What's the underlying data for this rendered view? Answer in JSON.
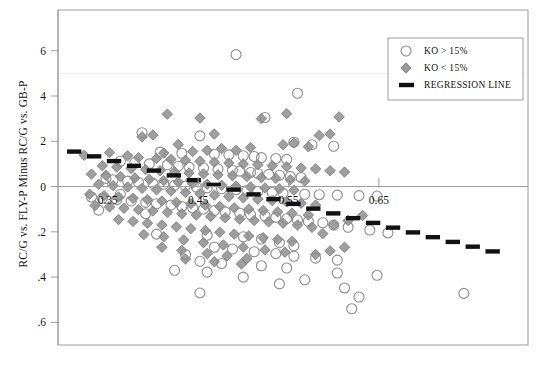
{
  "chart_data": {
    "type": "scatter",
    "title": "",
    "xlabel": "",
    "ylabel": "RC/G vs. FLY-P Minus RC/G vs. GB-P",
    "xlim": [
      0.295,
      0.815
    ],
    "ylim": [
      -0.7,
      0.78
    ],
    "grid": false,
    "x_ticks": [
      0.35,
      0.45,
      0.55,
      0.65
    ],
    "x_tick_labels": [
      "0.35",
      "0.45",
      "0.55",
      "0.65"
    ],
    "y_ticks": [
      0.6,
      0.4,
      0.2,
      0.0,
      -0.2,
      -0.4,
      -0.6
    ],
    "y_tick_labels": [
      "6",
      "4",
      "2",
      "0",
      ".2",
      ".4",
      ".6"
    ],
    "legend_position": "top-right",
    "legend": [
      {
        "label": "KO > 15%",
        "marker": "open-circle"
      },
      {
        "label": "KO < 15%",
        "marker": "gray-diamond"
      },
      {
        "label": "REGRESSION LINE",
        "marker": "thick-line"
      }
    ],
    "series": [
      {
        "name": "KO > 15%",
        "marker": "open-circle",
        "color": "#ffffff",
        "edge_color": "#8c8c8c",
        "points": [
          [
            0.492,
            0.583
          ],
          [
            0.56,
            0.412
          ],
          [
            0.524,
            0.305
          ],
          [
            0.388,
            0.238
          ],
          [
            0.452,
            0.224
          ],
          [
            0.556,
            0.196
          ],
          [
            0.576,
            0.185
          ],
          [
            0.6,
            0.178
          ],
          [
            0.408,
            0.152
          ],
          [
            0.432,
            0.147
          ],
          [
            0.468,
            0.143
          ],
          [
            0.484,
            0.14
          ],
          [
            0.5,
            0.136
          ],
          [
            0.512,
            0.133
          ],
          [
            0.52,
            0.128
          ],
          [
            0.536,
            0.124
          ],
          [
            0.548,
            0.12
          ],
          [
            0.364,
            0.112
          ],
          [
            0.38,
            0.106
          ],
          [
            0.396,
            0.1
          ],
          [
            0.416,
            0.096
          ],
          [
            0.428,
            0.09
          ],
          [
            0.44,
            0.086
          ],
          [
            0.456,
            0.082
          ],
          [
            0.472,
            0.078
          ],
          [
            0.488,
            0.072
          ],
          [
            0.496,
            0.068
          ],
          [
            0.508,
            0.062
          ],
          [
            0.516,
            0.058
          ],
          [
            0.528,
            0.054
          ],
          [
            0.54,
            0.05
          ],
          [
            0.552,
            0.045
          ],
          [
            0.564,
            0.04
          ],
          [
            0.348,
            0.036
          ],
          [
            0.356,
            0.03
          ],
          [
            0.372,
            0.024
          ],
          [
            0.384,
            0.019
          ],
          [
            0.4,
            0.014
          ],
          [
            0.412,
            0.01
          ],
          [
            0.424,
            0.006
          ],
          [
            0.436,
            0.002
          ],
          [
            0.448,
            -0.002
          ],
          [
            0.46,
            -0.006
          ],
          [
            0.476,
            -0.01
          ],
          [
            0.492,
            -0.014
          ],
          [
            0.504,
            -0.018
          ],
          [
            0.516,
            -0.022
          ],
          [
            0.532,
            -0.026
          ],
          [
            0.544,
            -0.03
          ],
          [
            0.568,
            -0.034
          ],
          [
            0.584,
            -0.036
          ],
          [
            0.604,
            -0.038
          ],
          [
            0.628,
            -0.04
          ],
          [
            0.648,
            -0.042
          ],
          [
            0.332,
            -0.046
          ],
          [
            0.344,
            -0.052
          ],
          [
            0.36,
            -0.058
          ],
          [
            0.376,
            -0.064
          ],
          [
            0.392,
            -0.07
          ],
          [
            0.404,
            -0.076
          ],
          [
            0.42,
            -0.082
          ],
          [
            0.432,
            -0.088
          ],
          [
            0.444,
            -0.094
          ],
          [
            0.456,
            -0.1
          ],
          [
            0.468,
            -0.106
          ],
          [
            0.48,
            -0.112
          ],
          [
            0.496,
            -0.118
          ],
          [
            0.508,
            -0.124
          ],
          [
            0.524,
            -0.13
          ],
          [
            0.536,
            -0.136
          ],
          [
            0.548,
            -0.142
          ],
          [
            0.56,
            -0.148
          ],
          [
            0.572,
            -0.154
          ],
          [
            0.588,
            -0.16
          ],
          [
            0.6,
            -0.17
          ],
          [
            0.616,
            -0.18
          ],
          [
            0.64,
            -0.192
          ],
          [
            0.66,
            -0.205
          ],
          [
            0.404,
            -0.21
          ],
          [
            0.46,
            -0.215
          ],
          [
            0.5,
            -0.222
          ],
          [
            0.52,
            -0.232
          ],
          [
            0.54,
            -0.248
          ],
          [
            0.556,
            -0.262
          ],
          [
            0.468,
            -0.268
          ],
          [
            0.488,
            -0.276
          ],
          [
            0.512,
            -0.288
          ],
          [
            0.536,
            -0.296
          ],
          [
            0.436,
            -0.3
          ],
          [
            0.556,
            -0.308
          ],
          [
            0.58,
            -0.316
          ],
          [
            0.604,
            -0.325
          ],
          [
            0.452,
            -0.33
          ],
          [
            0.476,
            -0.34
          ],
          [
            0.52,
            -0.35
          ],
          [
            0.548,
            -0.36
          ],
          [
            0.424,
            -0.37
          ],
          [
            0.46,
            -0.378
          ],
          [
            0.604,
            -0.382
          ],
          [
            0.648,
            -0.392
          ],
          [
            0.5,
            -0.4
          ],
          [
            0.568,
            -0.412
          ],
          [
            0.54,
            -0.43
          ],
          [
            0.612,
            -0.448
          ],
          [
            0.452,
            -0.47
          ],
          [
            0.628,
            -0.488
          ],
          [
            0.744,
            -0.472
          ],
          [
            0.62,
            -0.54
          ],
          [
            0.392,
            -0.12
          ],
          [
            0.34,
            -0.104
          ],
          [
            0.364,
            -0.034
          ]
        ]
      },
      {
        "name": "KO < 15%",
        "marker": "gray-diamond",
        "color": "#9a9a9a",
        "edge_color": "#6e6e6e",
        "points": [
          [
            0.548,
            0.322
          ],
          [
            0.606,
            0.308
          ],
          [
            0.416,
            0.32
          ],
          [
            0.452,
            0.303
          ],
          [
            0.52,
            0.3
          ],
          [
            0.584,
            0.226
          ],
          [
            0.596,
            0.232
          ],
          [
            0.4,
            0.228
          ],
          [
            0.388,
            0.22
          ],
          [
            0.468,
            0.232
          ],
          [
            0.428,
            0.186
          ],
          [
            0.544,
            0.185
          ],
          [
            0.556,
            0.192
          ],
          [
            0.572,
            0.176
          ],
          [
            0.508,
            0.172
          ],
          [
            0.492,
            0.16
          ],
          [
            0.476,
            0.168
          ],
          [
            0.46,
            0.16
          ],
          [
            0.444,
            0.155
          ],
          [
            0.412,
            0.148
          ],
          [
            0.352,
            0.15
          ],
          [
            0.324,
            0.138
          ],
          [
            0.372,
            0.136
          ],
          [
            0.384,
            0.128
          ],
          [
            0.404,
            0.124
          ],
          [
            0.42,
            0.12
          ],
          [
            0.436,
            0.116
          ],
          [
            0.452,
            0.112
          ],
          [
            0.468,
            0.108
          ],
          [
            0.484,
            0.104
          ],
          [
            0.5,
            0.1
          ],
          [
            0.516,
            0.096
          ],
          [
            0.532,
            0.092
          ],
          [
            0.548,
            0.088
          ],
          [
            0.564,
            0.082
          ],
          [
            0.58,
            0.078
          ],
          [
            0.596,
            0.07
          ],
          [
            0.612,
            0.064
          ],
          [
            0.344,
            0.092
          ],
          [
            0.36,
            0.086
          ],
          [
            0.376,
            0.08
          ],
          [
            0.392,
            0.075
          ],
          [
            0.408,
            0.07
          ],
          [
            0.424,
            0.065
          ],
          [
            0.44,
            0.06
          ],
          [
            0.456,
            0.056
          ],
          [
            0.472,
            0.052
          ],
          [
            0.488,
            0.048
          ],
          [
            0.504,
            0.044
          ],
          [
            0.52,
            0.04
          ],
          [
            0.536,
            0.036
          ],
          [
            0.552,
            0.03
          ],
          [
            0.568,
            0.024
          ],
          [
            0.332,
            0.055
          ],
          [
            0.348,
            0.05
          ],
          [
            0.364,
            0.044
          ],
          [
            0.38,
            0.038
          ],
          [
            0.396,
            0.032
          ],
          [
            0.412,
            0.026
          ],
          [
            0.428,
            0.02
          ],
          [
            0.444,
            0.014
          ],
          [
            0.46,
            0.01
          ],
          [
            0.476,
            0.006
          ],
          [
            0.492,
            0.002
          ],
          [
            0.508,
            -0.002
          ],
          [
            0.524,
            -0.006
          ],
          [
            0.54,
            -0.01
          ],
          [
            0.556,
            -0.016
          ],
          [
            0.34,
            0.01
          ],
          [
            0.356,
            0.004
          ],
          [
            0.372,
            -0.002
          ],
          [
            0.388,
            -0.008
          ],
          [
            0.404,
            -0.014
          ],
          [
            0.42,
            -0.02
          ],
          [
            0.436,
            -0.026
          ],
          [
            0.452,
            -0.032
          ],
          [
            0.468,
            -0.038
          ],
          [
            0.484,
            -0.044
          ],
          [
            0.5,
            -0.05
          ],
          [
            0.516,
            -0.056
          ],
          [
            0.532,
            -0.062
          ],
          [
            0.548,
            -0.068
          ],
          [
            0.564,
            -0.074
          ],
          [
            0.58,
            -0.082
          ],
          [
            0.33,
            -0.034
          ],
          [
            0.346,
            -0.04
          ],
          [
            0.362,
            -0.046
          ],
          [
            0.378,
            -0.052
          ],
          [
            0.394,
            -0.058
          ],
          [
            0.41,
            -0.064
          ],
          [
            0.426,
            -0.07
          ],
          [
            0.442,
            -0.076
          ],
          [
            0.458,
            -0.082
          ],
          [
            0.474,
            -0.088
          ],
          [
            0.49,
            -0.094
          ],
          [
            0.506,
            -0.1
          ],
          [
            0.522,
            -0.106
          ],
          [
            0.538,
            -0.112
          ],
          [
            0.554,
            -0.118
          ],
          [
            0.572,
            -0.126
          ],
          [
            0.336,
            -0.084
          ],
          [
            0.352,
            -0.09
          ],
          [
            0.368,
            -0.096
          ],
          [
            0.384,
            -0.102
          ],
          [
            0.4,
            -0.108
          ],
          [
            0.416,
            -0.114
          ],
          [
            0.432,
            -0.12
          ],
          [
            0.448,
            -0.126
          ],
          [
            0.464,
            -0.132
          ],
          [
            0.48,
            -0.138
          ],
          [
            0.496,
            -0.144
          ],
          [
            0.512,
            -0.15
          ],
          [
            0.528,
            -0.156
          ],
          [
            0.544,
            -0.162
          ],
          [
            0.56,
            -0.17
          ],
          [
            0.576,
            -0.18
          ],
          [
            0.362,
            -0.146
          ],
          [
            0.378,
            -0.154
          ],
          [
            0.394,
            -0.162
          ],
          [
            0.41,
            -0.17
          ],
          [
            0.426,
            -0.178
          ],
          [
            0.442,
            -0.186
          ],
          [
            0.458,
            -0.194
          ],
          [
            0.474,
            -0.202
          ],
          [
            0.49,
            -0.21
          ],
          [
            0.506,
            -0.218
          ],
          [
            0.522,
            -0.226
          ],
          [
            0.538,
            -0.234
          ],
          [
            0.554,
            -0.242
          ],
          [
            0.39,
            -0.212
          ],
          [
            0.412,
            -0.222
          ],
          [
            0.434,
            -0.236
          ],
          [
            0.456,
            -0.248
          ],
          [
            0.478,
            -0.258
          ],
          [
            0.5,
            -0.268
          ],
          [
            0.524,
            -0.28
          ],
          [
            0.546,
            -0.29
          ],
          [
            0.41,
            -0.268
          ],
          [
            0.432,
            -0.282
          ],
          [
            0.46,
            -0.296
          ],
          [
            0.482,
            -0.306
          ],
          [
            0.504,
            -0.318
          ],
          [
            0.436,
            -0.32
          ],
          [
            0.468,
            -0.332
          ],
          [
            0.498,
            -0.342
          ],
          [
            0.58,
            -0.3
          ],
          [
            0.596,
            -0.284
          ],
          [
            0.612,
            -0.268
          ],
          [
            0.6,
            -0.17
          ],
          [
            0.616,
            -0.15
          ],
          [
            0.632,
            -0.128
          ],
          [
            0.588,
            -0.208
          ]
        ]
      }
    ],
    "regression_line": {
      "label": "REGRESSION LINE",
      "color": "#111111",
      "style": "thick-dashed",
      "x_start": 0.305,
      "x_end": 0.79,
      "y_start": 0.162,
      "y_end": -0.3,
      "slope": -0.953,
      "intercept": 0.453
    }
  }
}
